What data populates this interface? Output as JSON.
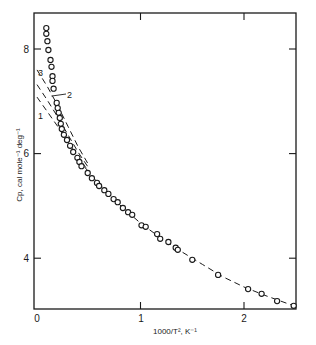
{
  "chart_data": {
    "type": "scatter",
    "title": "",
    "xlabel": "1000/T², K⁻¹",
    "ylabel": "Cp, cal mole⁻¹ deg⁻¹",
    "xlim": [
      0,
      2.5
    ],
    "ylim": [
      3.08,
      8.7
    ],
    "x_ticks": [
      0,
      1,
      2
    ],
    "x_tick_labels": [
      "0",
      "1",
      "2"
    ],
    "y_ticks": [
      4,
      6,
      8
    ],
    "y_tick_labels": [
      "4",
      "6",
      "8"
    ],
    "grid": false,
    "legend": null,
    "series": [
      {
        "name": "experimental",
        "marker": "open-circle",
        "points": [
          [
            0.09,
            8.4
          ],
          [
            0.09,
            8.29
          ],
          [
            0.1,
            8.15
          ],
          [
            0.11,
            7.98
          ],
          [
            0.13,
            7.79
          ],
          [
            0.14,
            7.66
          ],
          [
            0.15,
            7.48
          ],
          [
            0.15,
            7.39
          ],
          [
            0.16,
            7.24
          ],
          [
            0.19,
            6.97
          ],
          [
            0.2,
            6.87
          ],
          [
            0.21,
            6.78
          ],
          [
            0.22,
            6.68
          ],
          [
            0.23,
            6.57
          ],
          [
            0.24,
            6.47
          ],
          [
            0.26,
            6.36
          ],
          [
            0.29,
            6.26
          ],
          [
            0.32,
            6.15
          ],
          [
            0.35,
            6.03
          ],
          [
            0.39,
            5.92
          ],
          [
            0.41,
            5.84
          ],
          [
            0.43,
            5.76
          ],
          [
            0.49,
            5.63
          ],
          [
            0.53,
            5.53
          ],
          [
            0.58,
            5.44
          ],
          [
            0.6,
            5.38
          ],
          [
            0.65,
            5.3
          ],
          [
            0.69,
            5.23
          ],
          [
            0.74,
            5.13
          ],
          [
            0.78,
            5.07
          ],
          [
            0.83,
            4.96
          ],
          [
            0.88,
            4.88
          ],
          [
            0.92,
            4.83
          ],
          [
            1.01,
            4.63
          ],
          [
            1.05,
            4.6
          ],
          [
            1.16,
            4.46
          ],
          [
            1.19,
            4.37
          ],
          [
            1.27,
            4.31
          ],
          [
            1.34,
            4.2
          ],
          [
            1.36,
            4.16
          ],
          [
            1.5,
            3.97
          ],
          [
            1.75,
            3.68
          ],
          [
            2.04,
            3.41
          ],
          [
            2.17,
            3.32
          ],
          [
            2.32,
            3.18
          ],
          [
            2.48,
            3.09
          ]
        ]
      },
      {
        "name": "fit-main",
        "style": "dashed",
        "points": [
          [
            0.4,
            5.88
          ],
          [
            0.6,
            5.42
          ],
          [
            0.8,
            5.02
          ],
          [
            1.0,
            4.67
          ],
          [
            1.2,
            4.38
          ],
          [
            1.4,
            4.12
          ],
          [
            1.6,
            3.88
          ],
          [
            1.8,
            3.64
          ],
          [
            2.0,
            3.45
          ],
          [
            2.2,
            3.29
          ],
          [
            2.48,
            3.09
          ]
        ]
      },
      {
        "name": "1",
        "style": "dashed",
        "points": [
          [
            0.0,
            7.08
          ],
          [
            0.1,
            6.8
          ],
          [
            0.2,
            6.52
          ],
          [
            0.3,
            6.22
          ],
          [
            0.4,
            5.92
          ],
          [
            0.5,
            5.66
          ]
        ]
      },
      {
        "name": "2",
        "style": "dashed",
        "points": [
          [
            0.0,
            7.32
          ],
          [
            0.1,
            7.02
          ],
          [
            0.2,
            6.7
          ],
          [
            0.3,
            6.36
          ],
          [
            0.4,
            6.02
          ],
          [
            0.5,
            5.72
          ]
        ]
      },
      {
        "name": "3",
        "style": "dashed",
        "points": [
          [
            0.0,
            7.6
          ],
          [
            0.1,
            7.28
          ],
          [
            0.2,
            6.92
          ],
          [
            0.3,
            6.52
          ],
          [
            0.4,
            6.12
          ],
          [
            0.5,
            5.78
          ]
        ]
      }
    ],
    "annotations": [
      {
        "text": "1",
        "x": 0.02,
        "y": 6.75
      },
      {
        "text": "2",
        "x": 0.3,
        "y": 7.2,
        "leader_to": [
          0.14,
          7.1
        ]
      },
      {
        "text": "3",
        "x": 0.04,
        "y": 7.55
      }
    ]
  },
  "axes": {
    "x_label": "1000/T², K⁻¹",
    "y_label": "Cp, cal mole⁻¹ deg⁻¹",
    "x_tick_labels": [
      "0",
      "1",
      "2"
    ],
    "y_tick_labels": [
      "4",
      "6",
      "8"
    ]
  },
  "curve_labels": [
    "1",
    "2",
    "3"
  ]
}
